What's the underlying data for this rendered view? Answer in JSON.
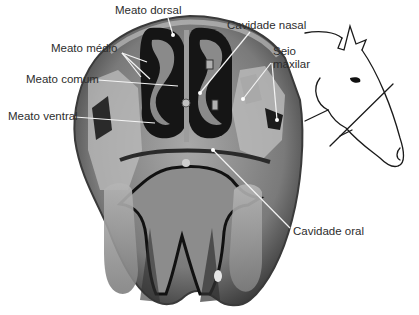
{
  "diagram": {
    "labels": {
      "meato_dorsal": "Meato dorsal",
      "meato_medio": "Meato médio",
      "meato_comum": "Meato comum",
      "meato_ventral": "Meato ventral",
      "cavidade_nasal": "Cavidade nasal",
      "seio_maxilar_line1": "Seio",
      "seio_maxilar_line2": "maxilar",
      "cavidade_oral": "Cavidade oral"
    },
    "icons": {
      "section": "anatomical-cross-section-image",
      "horse": "horse-head-sketch-icon"
    },
    "colors": {
      "background": "#ffffff",
      "label_text": "#2d2d2d",
      "leader_line": "#f2f2f2",
      "tissue_dark": "#1a1a1a",
      "tissue_mid": "#6e6e6e",
      "tissue_light": "#b9b9b9"
    }
  }
}
